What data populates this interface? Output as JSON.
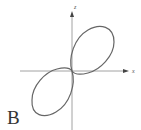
{
  "figure": {
    "panel_label": "B",
    "axes": {
      "x_label": "x",
      "y_label": "z",
      "color": "#888888",
      "origin_px": [
        72,
        71
      ]
    },
    "curve": {
      "description": "figure-eight (lemniscate-like) curve with two loops in quadrants I and III, crossing at the origin",
      "color": "#666666",
      "stroke_width": 1.2
    }
  }
}
